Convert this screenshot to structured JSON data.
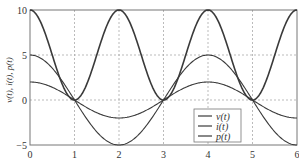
{
  "chart_data": {
    "type": "line",
    "title": "",
    "xlabel": "",
    "ylabel": "v(t), i(t), p(t)",
    "xlim": [
      0,
      6
    ],
    "ylim": [
      -5,
      10
    ],
    "xticks": [
      "0",
      "1",
      "2",
      "3",
      "4",
      "5",
      "6"
    ],
    "yticks": [
      "-5",
      "0",
      "5",
      "10"
    ],
    "grid": true,
    "legend_position": "lower right (inside, centered near x=4)",
    "series": [
      {
        "name": "v(t)",
        "formula": "5cos(pi t/2)",
        "x": [
          0,
          1,
          2,
          3,
          4,
          5,
          6
        ],
        "values": [
          5,
          0,
          -5,
          0,
          5,
          0,
          -5
        ]
      },
      {
        "name": "i(t)",
        "formula": "2cos(pi t/2)",
        "x": [
          0,
          1,
          2,
          3,
          4,
          5,
          6
        ],
        "values": [
          2,
          0,
          -2,
          0,
          2,
          0,
          -2
        ]
      },
      {
        "name": "p(t)",
        "formula": "10cos^2(pi t/2)",
        "x": [
          0,
          1,
          2,
          3,
          4,
          5,
          6
        ],
        "values": [
          10,
          0,
          10,
          0,
          10,
          0,
          10
        ]
      }
    ]
  },
  "axes": {
    "ylabel": "v(t), i(t), p(t)",
    "xticks": [
      "0",
      "1",
      "2",
      "3",
      "4",
      "5",
      "6"
    ],
    "yticks": [
      "−5",
      "0",
      "5",
      "10"
    ]
  },
  "legend": [
    "v(t)",
    "i(t)",
    "p(t)"
  ],
  "colors": {
    "line": "#3a3a3a",
    "grid": "#aaaaaa",
    "frame": "#777777"
  }
}
